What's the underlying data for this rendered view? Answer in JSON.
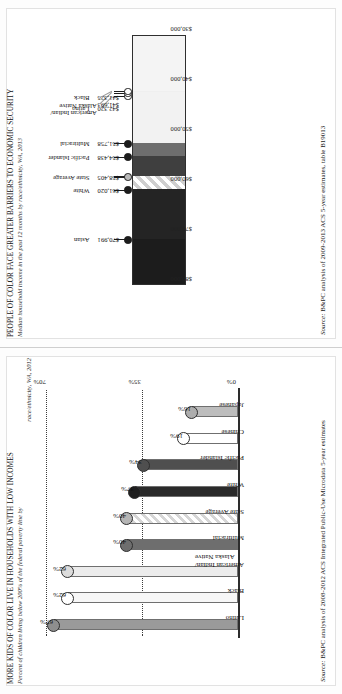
{
  "page": {
    "orientation_deg": -90,
    "background": "#fdfdfd"
  },
  "figures": [
    {
      "id": "kids-low-income",
      "title": "MORE KIDS OF COLOR LIVE IN HOUSEHOLDS WITH LOW INCOMES",
      "subtitle_line1": "Percent of children living below 200% of the federal poverty line by",
      "subtitle_line2": "race/ethnicity, WA, 2012",
      "source_prefix": "Source:",
      "source_text": "B&PC analysis of 2008-2012 ACS Integrated Public-Use Microdata 5-year estimates",
      "chart_data": {
        "type": "bar",
        "title": "MORE KIDS OF COLOR LIVE IN HOUSEHOLDS WITH LOW INCOMES",
        "subtitle": "Percent of children living below 200% of the federal poverty line by race/ethnicity, WA, 2012",
        "xlabel": "",
        "ylabel": "",
        "ylim": [
          0,
          70
        ],
        "yticks": [
          0,
          35,
          70
        ],
        "ytick_labels": [
          "0%",
          "35%",
          "70%"
        ],
        "grid": "dotted horizontal at 35% and 70%",
        "legend": "none",
        "categories": [
          "Latino",
          "Black",
          "American Indian/\nAlaska Native",
          "Multiracial",
          "State Average",
          "White",
          "Pacific Islander",
          "Chinese",
          "Japanese"
        ],
        "values": [
          67,
          62,
          62,
          40,
          40,
          37,
          34,
          19,
          16
        ],
        "value_labels": [
          "67%",
          "62%",
          "62%",
          "40%",
          "40%",
          "37%",
          "34%",
          "19%",
          "16%"
        ],
        "fills": [
          "#9a9a9a",
          "#f7f7f7",
          "#ececec",
          "#6e6e6e",
          "hatch",
          "#2a2a2a",
          "#4f4f4f",
          "#ffffff",
          "#bdbdbd"
        ],
        "dot_fills": [
          "#8e8e8e",
          "#ffffff",
          "#dcdcdc",
          "#6e6e6e",
          "#b5b5b5",
          "#1f1f1f",
          "#4f4f4f",
          "#ffffff",
          "#adadad"
        ]
      }
    },
    {
      "id": "median-household-income",
      "title": "PEOPLE OF COLOR FACE GREATER BARRIERS TO ECONOMIC SECURITY",
      "subtitle_line1": "Median household income in the past 12 months by race/ethnicity, WA, 2013",
      "subtitle_line2": "",
      "source_prefix": "Source:",
      "source_text": "B&PC analysis of 2009-2013 ACS 5-year estimates, table B19013",
      "chart_data": {
        "type": "bar",
        "title": "PEOPLE OF COLOR FACE GREATER BARRIERS TO ECONOMIC SECURITY",
        "subtitle": "Median household income in the past 12 months by race/ethnicity, WA, 2013",
        "xlabel": "",
        "ylabel": "",
        "ylim": [
          30000,
          80000
        ],
        "yticks": [
          80000,
          70000,
          60000,
          50000,
          40000,
          30000
        ],
        "ytick_labels": [
          "$80,000",
          "$70,000",
          "$60,000",
          "$50,000",
          "$40,000",
          "$30,000"
        ],
        "grid": "none",
        "legend": "none",
        "categories": [
          "Asian",
          "White",
          "State Average",
          "Pacific Islander",
          "Multiracial",
          "Latino",
          "American Indian/\nAlaska Native",
          "Black"
        ],
        "values": [
          70991,
          61020,
          58405,
          54438,
          51758,
          42320,
          41693,
          41325
        ],
        "value_labels": [
          "$70,991",
          "$61,020",
          "$58,405",
          "$54,438",
          "$51,758",
          "$42,320",
          "$41,693",
          "$41,325"
        ],
        "fills": [
          "#1c1c1c",
          "#242424",
          "hatch",
          "#3f3f3f",
          "#6e6e6e",
          "#f2f2f2",
          "#f2f2f2",
          "#efefef"
        ]
      }
    }
  ]
}
